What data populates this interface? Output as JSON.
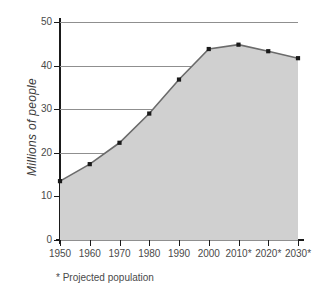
{
  "title_sliver": "",
  "footnote": "* Projected population",
  "axis_title_y": "Millions of people",
  "colors": {
    "area_fill": "#d0d0d0",
    "line": "#6b6b6b",
    "marker": "#1a1a1a",
    "gridline": "#8f8f8f",
    "axis": "#1a1a1a",
    "text": "#4a4a4a",
    "background": "#ffffff"
  },
  "yticks": [
    "50",
    "40",
    "30",
    "20",
    "10",
    "0"
  ],
  "xticks": [
    "1950",
    "1960",
    "1970",
    "1980",
    "1990",
    "2000",
    "2010*",
    "2020*",
    "2030*"
  ],
  "chart_data": {
    "type": "area",
    "title": "",
    "xlabel": "",
    "ylabel": "Millions of people",
    "categories": [
      "1950",
      "1960",
      "1970",
      "1980",
      "1990",
      "2000",
      "2010*",
      "2020*",
      "2030*"
    ],
    "values": [
      13.5,
      17.4,
      22.3,
      29.0,
      36.8,
      43.8,
      44.8,
      43.3,
      41.7
    ],
    "ylim": [
      0,
      50
    ],
    "ytick_step": 10,
    "grid": true,
    "legend": "none",
    "markers": true,
    "annotations": [
      "* Projected population"
    ]
  }
}
